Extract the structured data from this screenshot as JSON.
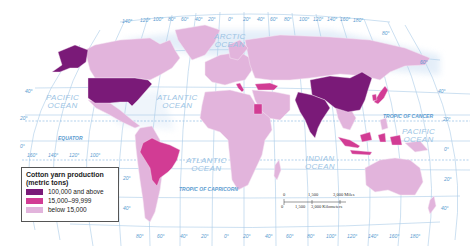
{
  "map": {
    "title": "Cotton yarn production",
    "projection": "world, curved graticule",
    "colors": {
      "high": "#7a1a78",
      "medium": "#d23c94",
      "low": "#e2b4dc",
      "ocean": "#ffffff",
      "graticule": "#a9cbe8",
      "border": "#f4e4f2"
    }
  },
  "legend": {
    "title_line1": "Cotton yarn production",
    "title_line2": "(metric tons)",
    "items": [
      {
        "label": "100,000 and above",
        "color": "#7a1a78"
      },
      {
        "label": "15,000–99,999",
        "color": "#d23c94"
      },
      {
        "label": "below 15,000",
        "color": "#e2b4dc"
      }
    ]
  },
  "oceans": {
    "arctic": "ARCTIC\nOCEAN",
    "arctic_l1": "ARCTIC",
    "arctic_l2": "OCEAN",
    "pacific_w_l1": "PACIFIC",
    "pacific_w_l2": "OCEAN",
    "atlantic_n_l1": "ATLANTIC",
    "atlantic_n_l2": "OCEAN",
    "atlantic_s_l1": "ATLANTIC",
    "atlantic_s_l2": "OCEAN",
    "indian_l1": "INDIAN",
    "indian_l2": "OCEAN",
    "pacific_e_l1": "PACIFIC",
    "pacific_e_l2": "OCEAN"
  },
  "lines": {
    "equator": "EQUATOR",
    "tropic_cancer": "TROPIC OF CANCER",
    "tropic_capricorn": "TROPIC OF CAPRICORN"
  },
  "graticule": {
    "top_longitudes": [
      "140°",
      "120°",
      "100°",
      "80°",
      "60°",
      "40°",
      "20°",
      "0°",
      "20°",
      "40°",
      "60°",
      "80°",
      "100°",
      "120°",
      "140°",
      "160°",
      "180°"
    ],
    "bottom_longitudes": [
      "80°",
      "60°",
      "40°",
      "20°",
      "0°",
      "20°",
      "40°",
      "60°",
      "80°",
      "100°",
      "120°",
      "140°",
      "160°",
      "180°"
    ],
    "left_bottom_longitudes": [
      "160°",
      "140°",
      "120°",
      "100°"
    ],
    "left_latitudes": [
      "40°",
      "20°",
      "0°"
    ],
    "right_latitudes": [
      "80°",
      "60°",
      "40°",
      "20°",
      "0°",
      "20°",
      "40°"
    ],
    "mid_latitudes": [
      "20°",
      "40°"
    ]
  },
  "scale_bar": {
    "miles_labels": [
      "0",
      "1,500",
      "3,000 Miles"
    ],
    "km_labels": [
      "0",
      "1,500",
      "3,000 Kilometers"
    ]
  },
  "countries": {
    "high": [
      "United States",
      "China",
      "India",
      "Pakistan"
    ],
    "medium": [
      "Brazil",
      "Turkey",
      "Egypt",
      "Italy",
      "Japan",
      "South Korea",
      "Indonesia"
    ],
    "low": [
      "Canada",
      "Greenland",
      "Russia",
      "Africa",
      "Europe",
      "Australia",
      "South America",
      "Mexico"
    ]
  }
}
